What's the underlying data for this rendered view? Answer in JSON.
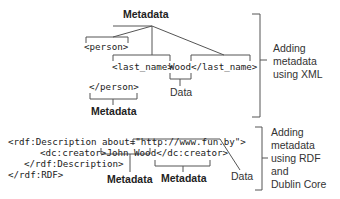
{
  "xml_section": {
    "top_label": "Metadata",
    "code": {
      "person_open": "<person>",
      "last_name_open": "<last_name>",
      "value": "Wood",
      "last_name_close": "</last_name>",
      "person_close": "</person>"
    },
    "data_label": "Data",
    "bottom_label": "Metadata",
    "side_caption": [
      "Adding",
      "metadata",
      "using XML"
    ]
  },
  "rdf_section": {
    "code": {
      "line1_prefix": "<rdf:Description about=\"",
      "url": "http://www.fun.by",
      "line1_suffix": "\">",
      "line2_open": "<dc:creator>",
      "line2_value": "John Wood",
      "line2_close": "</dc:creator>",
      "line3": "</rdf:Description>",
      "line4": "</rdf:RDF>"
    },
    "metadata_label_left": "Metadata",
    "metadata_label_right": "Metadata",
    "data_label": "Data",
    "side_caption": [
      "Adding",
      "metadata",
      "using RDF",
      "and",
      "Dublin Core"
    ]
  },
  "colors": {
    "line": "#555555",
    "text": "#222222"
  }
}
